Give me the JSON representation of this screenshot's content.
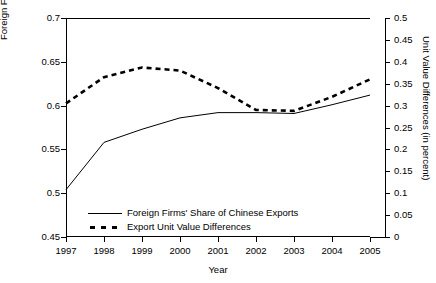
{
  "chart_data": {
    "type": "line",
    "title": "",
    "xlabel": "Year",
    "ylabel": "Foreign Firms' Share of Chinese Exports",
    "y2label": "Unit Value Differences (in percent)",
    "grid": false,
    "legend_position": "inside-bottom-left",
    "x": [
      1997,
      1998,
      1999,
      2000,
      2001,
      2002,
      2003,
      2004,
      2005
    ],
    "xtick_labels": [
      "1997",
      "1998",
      "1999",
      "2000",
      "2001",
      "2002",
      "2003",
      "2004",
      "2005"
    ],
    "xlim": [
      1996.5,
      2005.5
    ],
    "ylim": [
      0.45,
      0.7
    ],
    "ytick_labels": [
      "0.45",
      "0.5",
      "0.55",
      "0.6",
      "0.65",
      "0.7"
    ],
    "ytick_values": [
      0.45,
      0.5,
      0.55,
      0.6,
      0.65,
      0.7
    ],
    "y2lim": [
      0,
      0.5
    ],
    "y2tick_labels": [
      "0",
      "0.05",
      "0.1",
      "0.15",
      "0.2",
      "0.25",
      "0.3",
      "0.35",
      "0.4",
      "0.45",
      "0.5"
    ],
    "y2tick_values": [
      0,
      0.05,
      0.1,
      0.15,
      0.2,
      0.25,
      0.3,
      0.35,
      0.4,
      0.45,
      0.5
    ],
    "series": [
      {
        "name": "Foreign Firms' Share of Chinese Exports",
        "axis": "left",
        "style": "solid",
        "color": "#000000",
        "values": [
          0.504,
          0.558,
          0.573,
          0.586,
          0.592,
          0.592,
          0.591,
          0.601,
          0.612
        ]
      },
      {
        "name": "Export Unit Value Differences",
        "axis": "right",
        "style": "dashed",
        "color": "#000000",
        "values": [
          0.305,
          0.365,
          0.387,
          0.38,
          0.34,
          0.29,
          0.288,
          0.32,
          0.36
        ]
      }
    ],
    "legend_entries": [
      "Foreign Firms' Share of Chinese Exports",
      "Export Unit Value Differences"
    ]
  }
}
